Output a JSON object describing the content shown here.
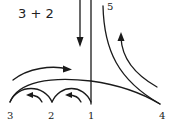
{
  "diagram": {
    "title": "3 + 2",
    "points": [
      {
        "id": "1",
        "label": "1"
      },
      {
        "id": "2",
        "label": "2"
      },
      {
        "id": "3",
        "label": "3"
      },
      {
        "id": "4",
        "label": "4"
      },
      {
        "id": "5",
        "label": "5"
      }
    ],
    "colors": {
      "ink": "#1a1a1a",
      "background": "#ffffff"
    }
  }
}
